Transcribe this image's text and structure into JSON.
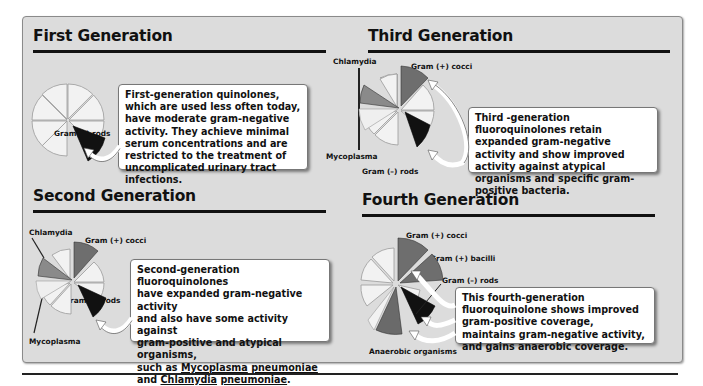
{
  "figure_title": "Quinolone / Fluoroquinolone generations – spectrum of activity",
  "colors": {
    "panel_bg": "#dcdcdc",
    "slice_inactive": "#f2f2f2",
    "gram_pos_cocci": "#6e6e6e",
    "gram_pos_bacilli": "#6e6e6e",
    "gram_neg_rods": "#111111",
    "chlamydia": "#8a8a8a",
    "mycoplasma": "#efefef",
    "anaerobic": "#6a6a6a"
  },
  "sections": {
    "first": {
      "title": "First Generation",
      "labels": {
        "gram_neg_rods": "Gram (–) rods"
      },
      "description": "First-generation quinolones, which are used less often today, have moderate gram-negative activity. They achieve minimal serum concentrations and are restricted to the treatment of uncomplicated urinary tract infections."
    },
    "second": {
      "title": "Second Generation",
      "labels": {
        "chlamydia": "Chlamydia",
        "gram_pos_cocci": "Gram (+) cocci",
        "gram_neg_rods": "Gram (–) rods",
        "mycoplasma": "Mycoplasma"
      },
      "description_lines": {
        "l1": "Second-generation fluoroquinolones",
        "l2": "have expanded gram-negative activity",
        "l3": "and also have some activity against",
        "l4": "gram-positive and atypical organisms,",
        "l5_prefix": "such as ",
        "l5_u1": "Mycoplasma",
        "l5_space": " ",
        "l5_u2": "pneumoniae",
        "l6_prefix": "and ",
        "l6_u1": "Chlamydia",
        "l6_space": " ",
        "l6_u2": "pneumoniae",
        "l6_suffix": "."
      }
    },
    "third": {
      "title": "Third Generation",
      "labels": {
        "chlamydia": "Chlamydia",
        "gram_pos_cocci": "Gram (+) cocci",
        "mycoplasma": "Mycoplasma",
        "gram_neg_rods": "Gram (–) rods"
      },
      "description": "Third -generation fluoroquinolones retain expanded gram-negative activity and show improved activity against atypical organisms and specific gram-positive bacteria."
    },
    "fourth": {
      "title": "Fourth Generation",
      "labels": {
        "gram_pos_cocci": "Gram (+) cocci",
        "gram_pos_bacilli": "Gram (+) bacilli",
        "gram_neg_rods": "Gram (–) rods",
        "anaerobic": "Anaerobic organisms"
      },
      "description": "This fourth-generation fluoroquinolone shows improved gram-positive coverage, maintains gram-negative activity, and gains anaerobic coverage."
    }
  }
}
